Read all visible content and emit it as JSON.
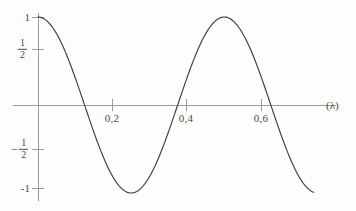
{
  "chart_data": {
    "type": "line",
    "title": "",
    "subtitle": "",
    "xlabel": "(λ)",
    "ylabel": "",
    "xlim": [
      0,
      0.74
    ],
    "ylim": [
      -1.08,
      1.08
    ],
    "grid": false,
    "legend": null,
    "x_ticks": [
      {
        "value": 0.2,
        "label": "0,2"
      },
      {
        "value": 0.4,
        "label": "0,4"
      },
      {
        "value": 0.6,
        "label": "0,6"
      }
    ],
    "y_ticks": [
      {
        "value": 1,
        "label": "1",
        "kind": "plain"
      },
      {
        "value": 0.5,
        "label": "1/2",
        "kind": "fraction",
        "numerator": "1",
        "denominator": "2",
        "sign": ""
      },
      {
        "value": -0.5,
        "label": "-1/2",
        "kind": "fraction",
        "numerator": "1",
        "denominator": "2",
        "sign": "−"
      },
      {
        "value": -1,
        "label": "-1",
        "kind": "plain"
      }
    ],
    "series": [
      {
        "name": "cosine",
        "formula": "y = cos(2πx / 0.5)",
        "period": 0.5,
        "amplitude": 1,
        "color": "#3d3d3d",
        "x": [
          0.0,
          0.02,
          0.04,
          0.06,
          0.08,
          0.1,
          0.12,
          0.14,
          0.16,
          0.18,
          0.2,
          0.22,
          0.24,
          0.26,
          0.28,
          0.3,
          0.32,
          0.34,
          0.36,
          0.38,
          0.4,
          0.42,
          0.44,
          0.46,
          0.48,
          0.5,
          0.52,
          0.54,
          0.56,
          0.58,
          0.6,
          0.62,
          0.64,
          0.66,
          0.68,
          0.7,
          0.72,
          0.74
        ],
        "y": [
          1.0,
          0.969,
          0.876,
          0.729,
          0.536,
          0.309,
          0.063,
          -0.187,
          -0.425,
          -0.637,
          -0.809,
          -0.93,
          -0.995,
          -0.998,
          -0.941,
          -0.825,
          -0.655,
          -0.443,
          -0.203,
          0.047,
          0.294,
          0.522,
          0.719,
          0.871,
          0.969,
          1.0,
          0.969,
          0.876,
          0.729,
          0.536,
          0.309,
          0.063,
          -0.187,
          -0.425,
          -0.637,
          -0.809,
          -0.93,
          -0.995
        ],
        "key_points": {
          "start": {
            "x": 0.0,
            "y": 1.0
          },
          "first_zero": {
            "x": 0.125,
            "y": 0.0
          },
          "minimum": {
            "x": 0.25,
            "y": -1.0
          },
          "second_zero": {
            "x": 0.375,
            "y": 0.0
          },
          "maximum": {
            "x": 0.5,
            "y": 1.0
          },
          "third_zero": {
            "x": 0.625,
            "y": 0.0
          },
          "end": {
            "x": 0.74,
            "y": -0.995
          }
        }
      }
    ],
    "axes": {
      "x_axis_color": "#9a9a9a",
      "y_axis_color": "#9a9a9a",
      "curve_color": "#3d3d3d",
      "background_color": "#fdfdfd",
      "x_axis_has_arrow": false,
      "y_axis_extends_below_zero": true
    }
  }
}
